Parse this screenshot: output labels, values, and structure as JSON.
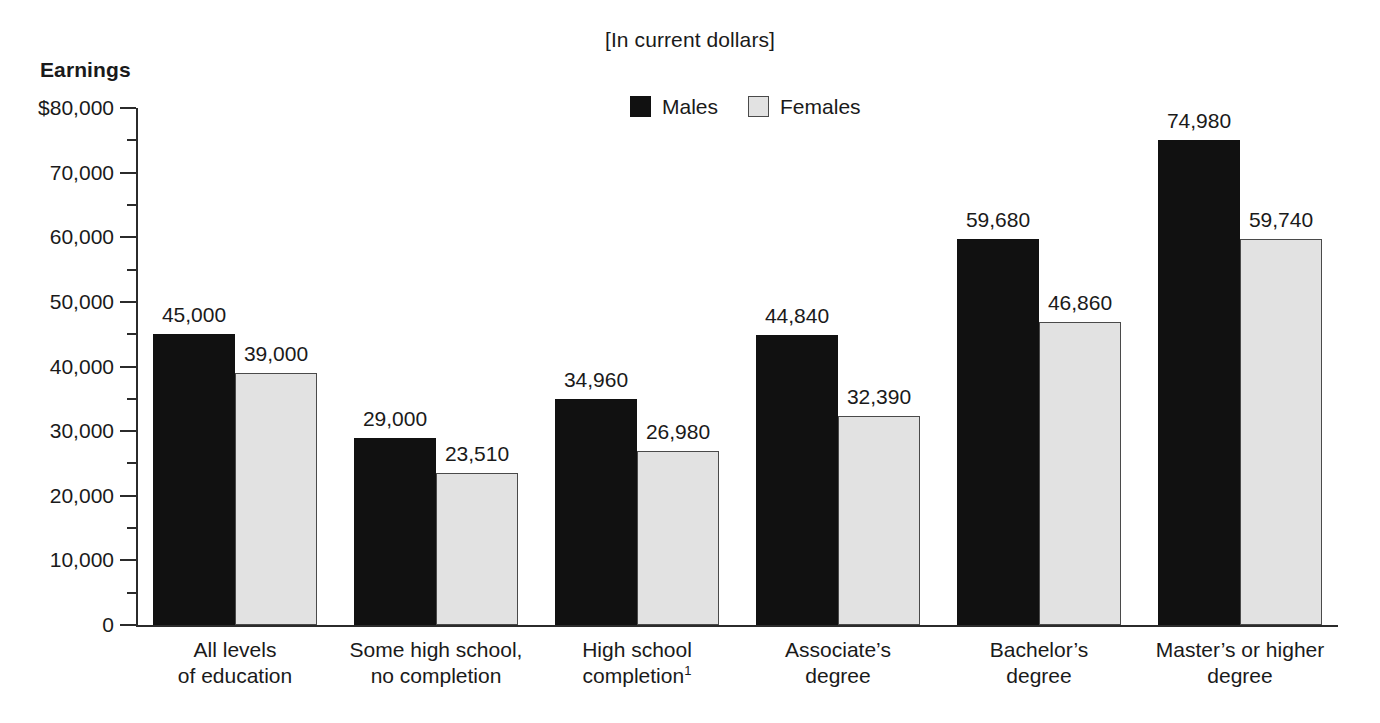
{
  "subtitle": "[In current dollars]",
  "y_axis_title": "Earnings",
  "legend": {
    "items": [
      {
        "label": "Males",
        "color": "#111111",
        "swatch": "filled-square-icon"
      },
      {
        "label": "Females",
        "color": "#e2e2e2",
        "swatch": "outlined-square-icon"
      }
    ]
  },
  "y_ticks": [
    "$80,000",
    "70,000",
    "60,000",
    "50,000",
    "40,000",
    "30,000",
    "20,000",
    "10,000",
    "0"
  ],
  "categories": [
    {
      "line1": "All levels",
      "line2": "of education",
      "footnote": ""
    },
    {
      "line1": "Some high school,",
      "line2": "no completion",
      "footnote": ""
    },
    {
      "line1": "High school",
      "line2": "completion",
      "footnote": "1"
    },
    {
      "line1": "Associate’s",
      "line2": "degree",
      "footnote": ""
    },
    {
      "line1": "Bachelor’s",
      "line2": "degree",
      "footnote": ""
    },
    {
      "line1": "Master’s or higher",
      "line2": "degree",
      "footnote": ""
    }
  ],
  "values": {
    "males": [
      "45,000",
      "29,000",
      "34,960",
      "44,840",
      "59,680",
      "74,980"
    ],
    "females": [
      "39,000",
      "23,510",
      "26,980",
      "32,390",
      "46,860",
      "59,740"
    ]
  },
  "chart_data": {
    "type": "bar",
    "title": "",
    "subtitle": "[In current dollars]",
    "xlabel": "",
    "ylabel": "Earnings",
    "ylim": [
      0,
      80000
    ],
    "ytick_values": [
      0,
      10000,
      20000,
      30000,
      40000,
      50000,
      60000,
      70000,
      80000
    ],
    "ytick_labels": [
      "0",
      "10,000",
      "20,000",
      "30,000",
      "40,000",
      "50,000",
      "60,000",
      "70,000",
      "$80,000"
    ],
    "yminor_tick_interval": 5000,
    "grid": false,
    "legend_position": "top-center",
    "categories": [
      "All levels of education",
      "Some high school, no completion",
      "High school completion¹",
      "Associate’s degree",
      "Bachelor’s degree",
      "Master’s or higher degree"
    ],
    "series": [
      {
        "name": "Males",
        "color": "#111111",
        "values": [
          45000,
          29000,
          34960,
          44840,
          59680,
          74980
        ]
      },
      {
        "name": "Females",
        "color": "#e2e2e2",
        "values": [
          39000,
          23510,
          26980,
          32390,
          46860,
          59740
        ]
      }
    ],
    "data_labels": {
      "Males": [
        "45,000",
        "29,000",
        "34,960",
        "44,840",
        "59,680",
        "74,980"
      ],
      "Females": [
        "39,000",
        "23,510",
        "26,980",
        "32,390",
        "46,860",
        "59,740"
      ]
    },
    "annotations": [
      "1 = footnote marker on “High school completion”"
    ]
  },
  "layout": {
    "plot_height_px": 517,
    "y_max": 80000,
    "bar_width_px": 82,
    "group_pitch_px": 201,
    "group_start_px": 17
  }
}
